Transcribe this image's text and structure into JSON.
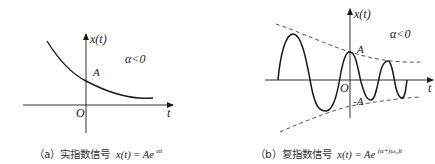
{
  "panel_a": {
    "y_axis_label": "x(t)",
    "x_axis_label": "t",
    "origin_label": "O",
    "amplitude_label": "A",
    "condition": "α<0",
    "caption_prefix": "（a）实指数信号",
    "caption_formula_lhs": "x(t) = Ae",
    "caption_formula_exp": "αt"
  },
  "panel_b": {
    "y_axis_label": "x(t)",
    "x_axis_label": "t",
    "origin_label": "O",
    "amplitude_label": "A",
    "neg_amplitude_label": "-A",
    "condition": "α<0",
    "caption_prefix": "（b）复指数信号",
    "caption_formula_lhs": "x(t) = Ae",
    "caption_formula_exp": "(α+jω₀)t"
  },
  "colors": {
    "stroke": "#1a1a1a",
    "dashed": "#555555",
    "text": "#222222"
  }
}
